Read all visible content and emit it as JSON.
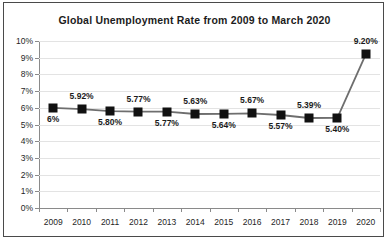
{
  "chart_data": {
    "type": "line",
    "title": "Global Unemployment Rate from 2009 to March 2020",
    "xlabel": "",
    "ylabel": "",
    "categories": [
      "2009",
      "2010",
      "2011",
      "2012",
      "2013",
      "2014",
      "2015",
      "2016",
      "2017",
      "2018",
      "2019",
      "2020"
    ],
    "values": [
      6.0,
      5.92,
      5.8,
      5.77,
      5.77,
      5.63,
      5.64,
      5.67,
      5.57,
      5.39,
      5.4,
      9.2
    ],
    "point_labels": [
      "6%",
      "5.92%",
      "5.80%",
      "5.77%",
      "5.77%",
      "5.63%",
      "5.64%",
      "5.67%",
      "5.57%",
      "5.39%",
      "5.40%",
      "9.20%"
    ],
    "label_positions": [
      "below",
      "above",
      "below",
      "above",
      "below",
      "above",
      "below",
      "above",
      "below",
      "above",
      "below",
      "above"
    ],
    "ylim": [
      0,
      10
    ],
    "ytick_values": [
      10,
      9,
      8,
      7,
      6,
      5,
      4,
      3,
      2,
      1,
      0
    ],
    "ytick_labels": [
      "10%",
      "9%",
      "8%",
      "7%",
      "6%",
      "5%",
      "4%",
      "3%",
      "2%",
      "1%",
      "0%"
    ],
    "grid": true,
    "legend": false,
    "series_color": "#6e6e6e",
    "marker_color": "#111111",
    "axis_color": "#8a8a8a",
    "grid_color": "#e3e3e3"
  }
}
